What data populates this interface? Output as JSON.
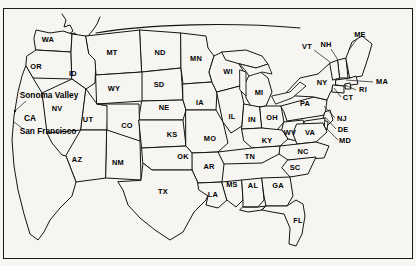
{
  "figure": {
    "name": "united-states-map",
    "background_color": "#f6f5f2",
    "outline_color": "#1a1a1a",
    "label_color": "#000000",
    "frame": true
  },
  "state_labels": [
    {
      "abbr": "WA",
      "x": 48,
      "y": 40
    },
    {
      "abbr": "OR",
      "x": 36,
      "y": 67
    },
    {
      "abbr": "ID",
      "x": 73,
      "y": 74
    },
    {
      "abbr": "MT",
      "x": 112,
      "y": 53
    },
    {
      "abbr": "ND",
      "x": 160,
      "y": 53
    },
    {
      "abbr": "MN",
      "x": 196,
      "y": 59
    },
    {
      "abbr": "WY",
      "x": 114,
      "y": 89
    },
    {
      "abbr": "SD",
      "x": 159,
      "y": 85
    },
    {
      "abbr": "NE",
      "x": 164,
      "y": 108
    },
    {
      "abbr": "IA",
      "x": 200,
      "y": 103
    },
    {
      "abbr": "WI",
      "x": 228,
      "y": 72
    },
    {
      "abbr": "MI",
      "x": 259,
      "y": 93
    },
    {
      "abbr": "NV",
      "x": 57,
      "y": 109
    },
    {
      "abbr": "UT",
      "x": 88,
      "y": 120
    },
    {
      "abbr": "CO",
      "x": 127,
      "y": 126
    },
    {
      "abbr": "KS",
      "x": 172,
      "y": 135
    },
    {
      "abbr": "MO",
      "x": 210,
      "y": 139
    },
    {
      "abbr": "IL",
      "x": 232,
      "y": 117
    },
    {
      "abbr": "IN",
      "x": 252,
      "y": 120
    },
    {
      "abbr": "OH",
      "x": 272,
      "y": 118
    },
    {
      "abbr": "PA",
      "x": 305,
      "y": 104
    },
    {
      "abbr": "NY",
      "x": 322,
      "y": 83
    },
    {
      "abbr": "VT",
      "x": 307,
      "y": 47
    },
    {
      "abbr": "NH",
      "x": 326,
      "y": 45
    },
    {
      "abbr": "ME",
      "x": 360,
      "y": 35
    },
    {
      "abbr": "MA",
      "x": 382,
      "y": 82
    },
    {
      "abbr": "RI",
      "x": 363,
      "y": 90
    },
    {
      "abbr": "CT",
      "x": 348,
      "y": 98
    },
    {
      "abbr": "NJ",
      "x": 342,
      "y": 119
    },
    {
      "abbr": "DE",
      "x": 343,
      "y": 130
    },
    {
      "abbr": "MD",
      "x": 345,
      "y": 141
    },
    {
      "abbr": "WV",
      "x": 290,
      "y": 133
    },
    {
      "abbr": "VA",
      "x": 310,
      "y": 133
    },
    {
      "abbr": "KY",
      "x": 267,
      "y": 141
    },
    {
      "abbr": "NC",
      "x": 303,
      "y": 152
    },
    {
      "abbr": "SC",
      "x": 295,
      "y": 168
    },
    {
      "abbr": "TN",
      "x": 250,
      "y": 157
    },
    {
      "abbr": "AR",
      "x": 209,
      "y": 167
    },
    {
      "abbr": "OK",
      "x": 183,
      "y": 157
    },
    {
      "abbr": "AZ",
      "x": 77,
      "y": 160
    },
    {
      "abbr": "NM",
      "x": 118,
      "y": 163
    },
    {
      "abbr": "TX",
      "x": 163,
      "y": 192
    },
    {
      "abbr": "LA",
      "x": 213,
      "y": 195
    },
    {
      "abbr": "MS",
      "x": 232,
      "y": 185
    },
    {
      "abbr": "AL",
      "x": 253,
      "y": 186
    },
    {
      "abbr": "GA",
      "x": 278,
      "y": 186
    },
    {
      "abbr": "FL",
      "x": 298,
      "y": 221
    }
  ],
  "place_labels": [
    {
      "name": "Sonoma Valley",
      "x": 49,
      "y": 95
    },
    {
      "name": "CA",
      "x": 30,
      "y": 118
    },
    {
      "name": "San Francisco",
      "x": 48,
      "y": 131
    }
  ],
  "leader_lines": [
    {
      "from": "Sonoma Valley",
      "x1": 26,
      "y1": 101,
      "x2": 16,
      "y2": 110
    },
    {
      "from": "San Francisco",
      "x1": 22,
      "y1": 128,
      "x2": 14,
      "y2": 122
    },
    {
      "from": "VT",
      "x1": 314,
      "y1": 50,
      "x2": 330,
      "y2": 62
    },
    {
      "from": "NH",
      "x1": 331,
      "y1": 49,
      "x2": 338,
      "y2": 60
    },
    {
      "from": "ME",
      "x1": 357,
      "y1": 39,
      "x2": 349,
      "y2": 50
    },
    {
      "from": "MA",
      "x1": 373,
      "y1": 82,
      "x2": 346,
      "y2": 80
    },
    {
      "from": "RI",
      "x1": 356,
      "y1": 90,
      "x2": 345,
      "y2": 85
    },
    {
      "from": "CT",
      "x1": 341,
      "y1": 97,
      "x2": 334,
      "y2": 88
    },
    {
      "from": "NJ",
      "x1": 335,
      "y1": 118,
      "x2": 324,
      "y2": 106
    },
    {
      "from": "DE",
      "x1": 336,
      "y1": 129,
      "x2": 325,
      "y2": 117
    },
    {
      "from": "MD",
      "x1": 338,
      "y1": 140,
      "x2": 323,
      "y2": 125
    }
  ]
}
